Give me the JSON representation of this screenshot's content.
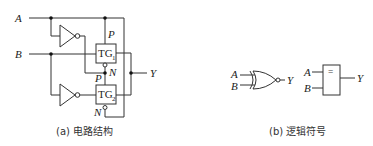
{
  "figure_a": {
    "caption": "(a) 电路结构",
    "inputs": {
      "a": "A",
      "b": "B"
    },
    "output": "Y",
    "gates": {
      "tg1": {
        "label": "TG",
        "sub": "1",
        "p_label": "P",
        "n_label": "N"
      },
      "tg2": {
        "label": "TG",
        "sub": "2",
        "p_label": "P",
        "n_label": "N"
      }
    },
    "inverters": [
      "inverter-1",
      "inverter-2"
    ]
  },
  "figure_b": {
    "caption": "(b) 逻辑符号",
    "xnor_symbol": {
      "in_a": "A",
      "in_b": "B",
      "out": "Y"
    },
    "iec_symbol": {
      "in_a": "A",
      "in_b": "B",
      "out": "Y",
      "function": "="
    }
  }
}
